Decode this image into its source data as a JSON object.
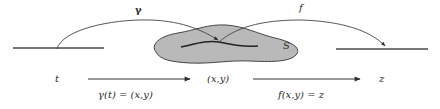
{
  "diagram": {
    "top_labels": {
      "gamma_arc": "γ",
      "f_arc": "f",
      "surface": "S"
    },
    "bottom_row": {
      "domain_var": "t",
      "middle_point": "(x,y)",
      "codomain_var": "z"
    },
    "equations": {
      "gamma_eq": "γ(t) = (x,y)",
      "f_eq": "f(x,y) = z"
    },
    "colors": {
      "stroke": "#3a3a3a",
      "surface_fill": "#b9b9b9",
      "text": "#2a2a2a"
    }
  }
}
